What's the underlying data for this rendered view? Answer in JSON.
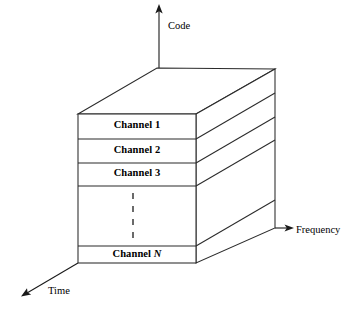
{
  "figure": {
    "type": "3d-block-diagram",
    "title": "",
    "background_color": "#ffffff",
    "line_color": "#2b2b2b",
    "text_color": "#000000"
  },
  "axes": [
    {
      "id": "code",
      "label": "Code",
      "direction": "up",
      "arrow": "up-arrow-icon",
      "label_x": 168,
      "label_y": 20
    },
    {
      "id": "frequency",
      "label": "Frequency",
      "direction": "right",
      "arrow": "right-arrow-icon",
      "label_x": 296,
      "label_y": 231
    },
    {
      "id": "time",
      "label": "Time",
      "direction": "down-left",
      "arrow": "down-left-arrow-icon",
      "label_x": 48,
      "label_y": 290
    }
  ],
  "block": {
    "front_face": {
      "left": 78,
      "right": 196,
      "top": 114,
      "bottom": 263
    },
    "depth_offset_x": 79,
    "depth_offset_y": -46
  },
  "channels": [
    {
      "name": "Channel 1",
      "italic_suffix": "",
      "label_center_x": 137,
      "label_center_y": 126,
      "row_top": 114,
      "row_bottom": 139
    },
    {
      "name": "Channel 2",
      "italic_suffix": "",
      "label_center_x": 137,
      "label_center_y": 151,
      "row_top": 139,
      "row_bottom": 163
    },
    {
      "name": "Channel 3",
      "italic_suffix": "",
      "label_center_x": 137,
      "label_center_y": 174,
      "row_top": 163,
      "row_bottom": 186
    },
    {
      "name": "Channel ",
      "italic_suffix": "N",
      "label_center_x": 137,
      "label_center_y": 254,
      "row_top": 246,
      "row_bottom": 263
    }
  ],
  "ellipsis": {
    "symbol": "vertical-dashed-line",
    "x": 133,
    "y_start": 193,
    "y_end": 242
  }
}
